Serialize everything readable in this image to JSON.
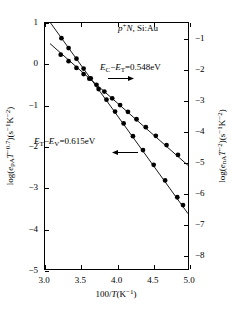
{
  "chart_data": {
    "type": "scatter",
    "title": "",
    "sample_label": "p⁺N, Si:Au",
    "xlabel": "100/T(K⁻¹)",
    "ylabel_left": "log(eₚₐT⁻⁰·⁷)(s⁻¹K⁻²)",
    "ylabel_right": "log(eₙₐT⁻²)(s⁻¹K⁻²)",
    "xlim": [
      3.0,
      5.0
    ],
    "ylim_left": [
      -5,
      1
    ],
    "ylim_right": [
      -8.5,
      -0.5
    ],
    "xticks": [
      "3.0",
      "3.5",
      "4.0",
      "4.5",
      "5.0"
    ],
    "xtick_values": [
      3.0,
      3.5,
      4.0,
      4.5,
      5.0
    ],
    "yticks_left": [
      "1",
      "0",
      "−1",
      "−2",
      "−3",
      "−4",
      "−5"
    ],
    "ytick_values_left": [
      1,
      0,
      -1,
      -2,
      -3,
      -4,
      -5
    ],
    "yticks_right": [
      "−1",
      "−2",
      "−3",
      "−4",
      "−5",
      "−6",
      "−7",
      "−8"
    ],
    "ytick_values_right": [
      -1,
      -2,
      -3,
      -4,
      -5,
      -6,
      -7,
      -8
    ],
    "grid": false,
    "legend": "none",
    "annotations": [
      {
        "id": "upper",
        "text": "Eᴄ−Eᴛ=0.548eV",
        "html": "<i>E</i><sub>C</sub>−<i>E</i><sub>T</sub>=0.548eV",
        "arrow": "right",
        "refers_to": "electron-emission-series"
      },
      {
        "id": "lower",
        "text": "Eᴛ−Eᴠ=0.615eV",
        "html": "<i>E</i><sub>T</sub>−<i>E</i><sub>V</sub>=0.615eV",
        "arrow": "left",
        "refers_to": "hole-emission-series"
      }
    ],
    "series": [
      {
        "name": "electron-emission-series",
        "axis": "right",
        "marker": "filled-circle",
        "line": "solid",
        "activation_energy_eV": 0.548,
        "x": [
          3.22,
          3.33,
          3.44,
          3.54,
          3.62,
          3.72,
          3.83,
          3.94,
          4.05,
          4.16,
          4.28,
          4.41,
          4.55,
          4.7,
          4.86
        ],
        "y": [
          -1.53,
          -1.74,
          -1.96,
          -2.16,
          -2.31,
          -2.51,
          -2.73,
          -2.95,
          -3.17,
          -3.39,
          -3.63,
          -3.89,
          -4.17,
          -4.47,
          -4.79
        ]
      },
      {
        "name": "hole-emission-series",
        "axis": "left",
        "marker": "filled-circle",
        "line": "solid",
        "activation_energy_eV": 0.615,
        "x": [
          3.23,
          3.33,
          3.44,
          3.54,
          3.64,
          3.75,
          3.86,
          3.98,
          4.1,
          4.23,
          4.37,
          4.52,
          4.68,
          4.85,
          4.93
        ],
        "y": [
          0.63,
          0.39,
          0.13,
          -0.11,
          -0.35,
          -0.61,
          -0.87,
          -1.16,
          -1.45,
          -1.76,
          -2.1,
          -2.46,
          -2.84,
          -3.25,
          -3.44
        ]
      }
    ],
    "fit_lines": [
      {
        "name": "electron-fit",
        "axis": "right",
        "x0": 3.07,
        "y0": -1.17,
        "x1": 5.0,
        "y1": -5.13
      },
      {
        "name": "hole-fit",
        "axis": "left",
        "x0": 3.07,
        "y0": 1.02,
        "x1": 5.0,
        "y1": -3.65
      }
    ]
  }
}
